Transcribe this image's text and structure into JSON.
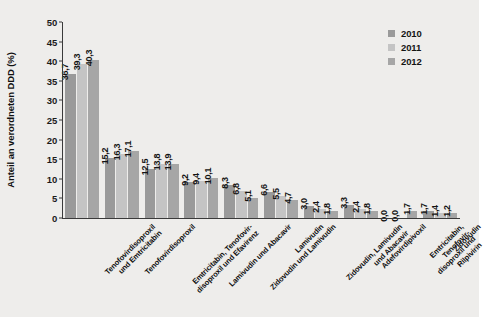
{
  "chart_data": {
    "type": "bar",
    "title": "",
    "xlabel": "",
    "ylabel": "Anteil an verordneten DDD (%)",
    "ylim": [
      0,
      50
    ],
    "yticks": [
      0,
      5,
      10,
      15,
      20,
      25,
      30,
      35,
      40,
      45,
      50
    ],
    "grid": false,
    "legend_position": "top-right",
    "categories": [
      "Tenofovirdisoproxil\nund Emtricitabin",
      "Tenofovirdisoproxil",
      "Emtricitabin, Tenofovir-\ndisoproxil und Efavirenz",
      "Lamivudin und Abacavir",
      "Zidovudin und Lamivudin",
      "Lamivudin",
      "Zidovudin, Lamivudin\nund Abacavir",
      "Adefovirdipivoxil",
      "Emtricitabin, Tenofovir-\ndisoproxil und Rilpivirin",
      "Zidovudin"
    ],
    "series": [
      {
        "name": "2010",
        "color": "#9a9a9a",
        "values": [
          36.7,
          15.2,
          12.5,
          9.2,
          8.3,
          6.6,
          3.0,
          3.3,
          0.0,
          1.7
        ],
        "labels": [
          "36,7",
          "15,2",
          "12,5",
          "9,2",
          "8,3",
          "6,6",
          "3,0",
          "3,3",
          "0,0",
          "1,7"
        ]
      },
      {
        "name": "2011",
        "color": "#c4c4c4",
        "values": [
          39.3,
          16.3,
          13.8,
          9.4,
          6.8,
          5.5,
          2.4,
          2.4,
          0.0,
          1.4
        ],
        "labels": [
          "39,3",
          "16,3",
          "13,8",
          "9,4",
          "6,8",
          "5,5",
          "2,4",
          "2,4",
          "0,0",
          "1,4"
        ]
      },
      {
        "name": "2012",
        "color": "#a6a6a6",
        "values": [
          40.3,
          17.1,
          13.9,
          10.1,
          5.1,
          4.7,
          1.8,
          1.8,
          1.7,
          1.2
        ],
        "labels": [
          "40,3",
          "17,1",
          "13,9",
          "10,1",
          "5,1",
          "4,7",
          "1,8",
          "1,8",
          "1,7",
          "1,2"
        ]
      }
    ]
  },
  "legend": {
    "items": [
      {
        "label": "2010",
        "color": "#9a9a9a"
      },
      {
        "label": "2011",
        "color": "#c4c4c4"
      },
      {
        "label": "2012",
        "color": "#a6a6a6"
      }
    ]
  }
}
